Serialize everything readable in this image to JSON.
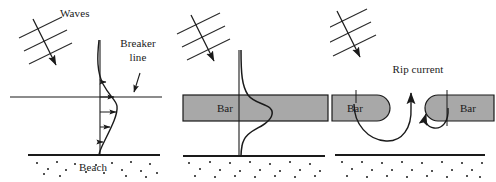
{
  "figure": {
    "width": 496,
    "height": 182,
    "background_color": "#ffffff",
    "line_color": "#1a1a1a",
    "bar_fill_color": "#a8a8a8"
  },
  "panels": [
    {
      "id": "panel-a",
      "name": "longshore-current-plane-beach",
      "labels": {
        "waves": "Waves",
        "breaker_line": "Breaker\nline",
        "breaker_line_line1": "Breaker",
        "breaker_line_line2": "line",
        "beach": "Beach"
      },
      "elements": {
        "wave_crest_count": 3,
        "velocity_arrow_count": 5,
        "has_breaker_line": true,
        "has_shoreline": true,
        "has_sand_stipple": true
      }
    },
    {
      "id": "panel-b",
      "name": "longshore-current-with-bar",
      "labels": {
        "bar": "Bar",
        "beach": ""
      },
      "elements": {
        "wave_crest_count": 3,
        "has_bar": true,
        "has_velocity_profile_curve": true,
        "has_shoreline": true,
        "has_sand_stipple": true
      }
    },
    {
      "id": "panel-c",
      "name": "rip-current-between-bars",
      "labels": {
        "rip_current": "Rip current",
        "bar_left": "Bar",
        "bar_right": "Bar"
      },
      "elements": {
        "wave_crest_count": 3,
        "bar_count": 2,
        "rip_arrow_count": 3,
        "has_shoreline": true,
        "has_sand_stipple": true
      }
    }
  ]
}
